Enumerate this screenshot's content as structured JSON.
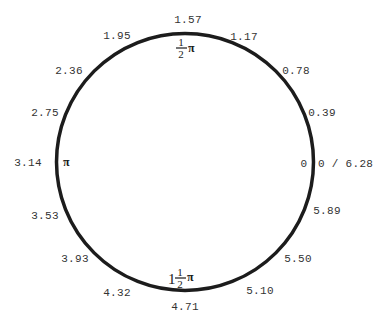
{
  "diagram": {
    "circle": {
      "cx": 185,
      "cy": 162,
      "r": 128.5,
      "stroke": "#1c1c1c",
      "stroke_width": 3.5
    },
    "tick_labels": [
      {
        "text": "1.57",
        "x": 188,
        "y": 23,
        "anchor": "middle"
      },
      {
        "text": "1.95",
        "x": 117,
        "y": 39,
        "anchor": "middle"
      },
      {
        "text": "1.17",
        "x": 244,
        "y": 40,
        "anchor": "middle"
      },
      {
        "text": "2.36",
        "x": 69,
        "y": 74,
        "anchor": "middle"
      },
      {
        "text": "0.78",
        "x": 296,
        "y": 74,
        "anchor": "middle"
      },
      {
        "text": "2.75",
        "x": 45,
        "y": 116,
        "anchor": "middle"
      },
      {
        "text": "0.39",
        "x": 322,
        "y": 116,
        "anchor": "middle"
      },
      {
        "text": "3.14",
        "x": 28,
        "y": 166,
        "anchor": "middle"
      },
      {
        "text": "0",
        "x": 304,
        "y": 167,
        "anchor": "middle"
      },
      {
        "text": "0 / 6.28",
        "x": 318,
        "y": 167,
        "anchor": "start"
      },
      {
        "text": "3.53",
        "x": 45,
        "y": 219,
        "anchor": "middle"
      },
      {
        "text": "5.89",
        "x": 327,
        "y": 214,
        "anchor": "middle"
      },
      {
        "text": "3.93",
        "x": 75,
        "y": 262,
        "anchor": "middle"
      },
      {
        "text": "5.50",
        "x": 298,
        "y": 262,
        "anchor": "middle"
      },
      {
        "text": "4.32",
        "x": 117,
        "y": 296,
        "anchor": "middle"
      },
      {
        "text": "5.10",
        "x": 260,
        "y": 294,
        "anchor": "middle"
      },
      {
        "text": "4.71",
        "x": 185,
        "y": 310,
        "anchor": "middle"
      }
    ],
    "pi_markers": {
      "pi": {
        "symbol": "π",
        "x": 63,
        "y": 166
      },
      "half_pi": {
        "numerator": "1",
        "denominator": "2",
        "symbol": "π",
        "x": 181,
        "y": 47
      },
      "one_and_half_pi": {
        "whole": "1",
        "numerator": "1",
        "denominator": "2",
        "symbol": "π",
        "x": 180,
        "y": 278
      }
    }
  }
}
